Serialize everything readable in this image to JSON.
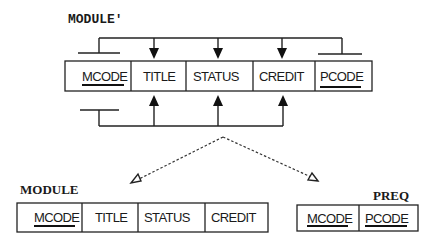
{
  "diagram": {
    "type": "relation-decomposition",
    "source_relation": {
      "name": "MODULE'",
      "attributes": [
        {
          "label": "MCODE",
          "key": true
        },
        {
          "label": "TITLE",
          "key": false
        },
        {
          "label": "STATUS",
          "key": false
        },
        {
          "label": "CREDIT",
          "key": false
        },
        {
          "label": "PCODE",
          "key": true
        }
      ]
    },
    "result_relations": [
      {
        "name": "MODULE",
        "attributes": [
          {
            "label": "MCODE",
            "key": true
          },
          {
            "label": "TITLE",
            "key": false
          },
          {
            "label": "STATUS",
            "key": false
          },
          {
            "label": "CREDIT",
            "key": false
          }
        ]
      },
      {
        "name": "PREQ",
        "attributes": [
          {
            "label": "MCODE",
            "key": true
          },
          {
            "label": "PCODE",
            "key": true
          }
        ]
      }
    ],
    "dependencies": {
      "top": "MCODE, PCODE -> TITLE, STATUS, CREDIT",
      "bottom": "MCODE -> TITLE, STATUS, CREDIT"
    },
    "colors": {
      "line": "#222222",
      "background": "#ffffff"
    }
  }
}
